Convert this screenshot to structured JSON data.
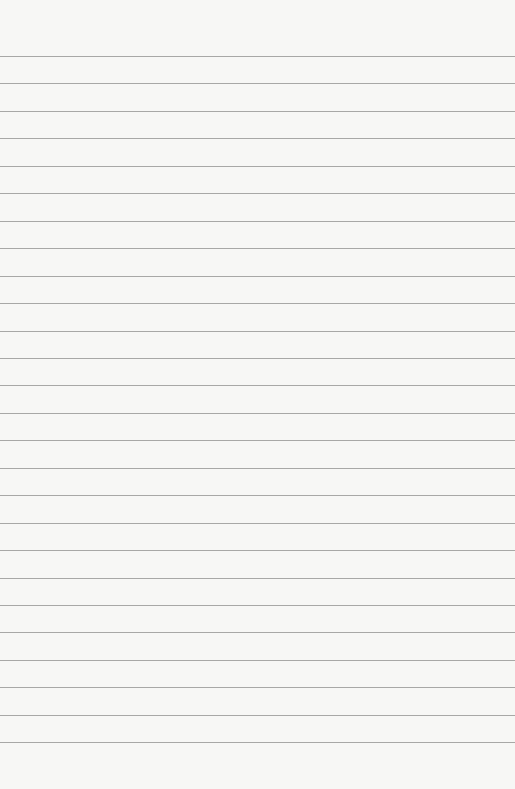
{
  "paper": {
    "type": "lined-notebook-paper",
    "background_color": "#f7f7f5",
    "line_color": "#9a9a98",
    "line_count": 26,
    "first_line_y": 56,
    "line_spacing": 27.45
  }
}
